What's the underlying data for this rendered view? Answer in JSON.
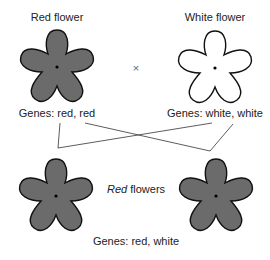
{
  "parents": {
    "left": {
      "title": "Red flower",
      "genes": "Genes: red, red",
      "color": "#6b6b6b"
    },
    "right": {
      "title": "White flower",
      "genes": "Genes: white, white",
      "color": "#ffffff"
    },
    "cross_symbol": "×"
  },
  "offspring": {
    "label_italic": "Red",
    "label_rest": " flowers",
    "genes": "Genes: red, white",
    "color": "#6b6b6b"
  }
}
